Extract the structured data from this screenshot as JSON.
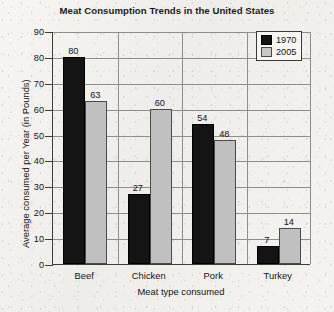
{
  "chart_data": {
    "type": "bar",
    "title": "Meat Consumption Trends in the United States",
    "xlabel": "Meat type consumed",
    "ylabel": "Average consumed per Year (in Pounds)",
    "categories": [
      "Beef",
      "Chicken",
      "Pork",
      "Turkey"
    ],
    "series": [
      {
        "name": "1970",
        "color": "#141414",
        "values": [
          80,
          27,
          54,
          7
        ]
      },
      {
        "name": "2005",
        "color": "#c0c0c0",
        "values": [
          63,
          60,
          48,
          14
        ]
      }
    ],
    "ylim": [
      0,
      90
    ],
    "ytick_step": 10,
    "yticks": [
      0,
      10,
      20,
      30,
      40,
      50,
      60,
      70,
      80,
      90
    ],
    "ytick_labels": [
      "0",
      "10",
      "20",
      "30",
      "40",
      "50",
      "60",
      "70",
      "80",
      "90"
    ],
    "grid": true,
    "grid_axis": "both",
    "data_labels": true,
    "legend": {
      "position": "top-right",
      "entries": [
        "1970",
        "2005"
      ]
    }
  }
}
